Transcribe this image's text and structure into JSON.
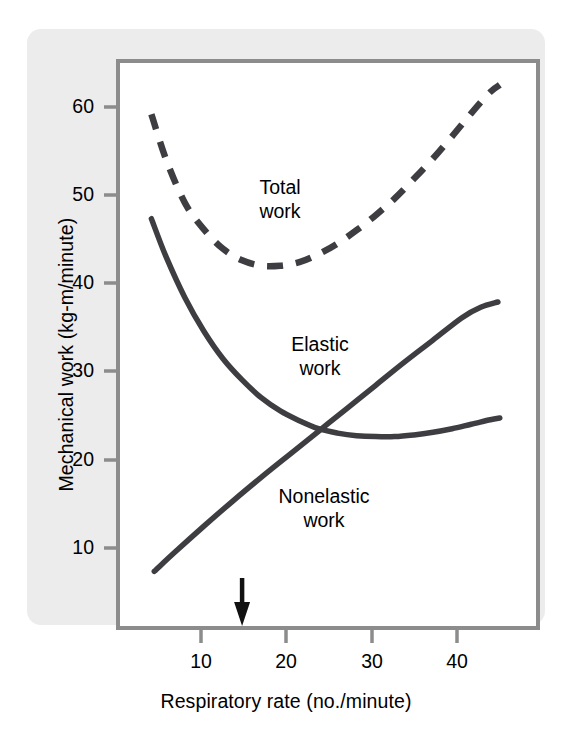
{
  "figure": {
    "background_color": "#ffffff",
    "card_color": "#ececec",
    "frame_color": "#8c8c8c",
    "curve_color": "#3e3e42",
    "text_color": "#000000"
  },
  "axes": {
    "x_title": "Respiratory rate (no./minute)",
    "y_title": "Mechanical work (kg-m/minute)",
    "x_ticks": [
      "10",
      "20",
      "30",
      "40"
    ],
    "y_ticks": [
      "60",
      "50",
      "40",
      "30",
      "20",
      "10"
    ]
  },
  "labels": {
    "total_line1": "Total",
    "total_line2": "work",
    "elastic_line1": "Elastic",
    "elastic_line2": "work",
    "nonelastic_line1": "Nonelastic",
    "nonelastic_line2": "work"
  },
  "annotations": {
    "optimum_arrow_label": "optimal respiratory rate arrow",
    "optimum_x_value": 15
  },
  "chart_data": {
    "type": "line",
    "title": "",
    "xlabel": "Respiratory rate (no./minute)",
    "ylabel": "Mechanical work (kg-m/minute)",
    "xlim": [
      2,
      46
    ],
    "ylim": [
      2,
      66
    ],
    "x_ticks": [
      10,
      20,
      30,
      40
    ],
    "y_ticks": [
      10,
      20,
      30,
      40,
      50,
      60
    ],
    "grid": false,
    "legend": "inline-labels",
    "annotations": [
      {
        "type": "arrow",
        "x": 15,
        "y": 2,
        "direction": "down",
        "note": "optimum respiratory rate"
      }
    ],
    "series": [
      {
        "name": "Total work",
        "style": "dashed",
        "x": [
          5.5,
          7,
          9,
          11,
          13,
          15,
          17,
          19,
          21,
          23,
          25,
          27,
          29,
          31,
          33,
          35,
          37,
          39,
          41,
          42
        ],
        "values": [
          60.0,
          55.0,
          50.0,
          47.0,
          44.8,
          43.5,
          42.9,
          42.9,
          43.3,
          44.2,
          45.4,
          46.9,
          48.6,
          50.5,
          52.7,
          55.0,
          57.5,
          60.1,
          62.5,
          63.3
        ]
      },
      {
        "name": "Elastic work",
        "style": "solid",
        "x": [
          5.5,
          7,
          9,
          11,
          13,
          15,
          17,
          19,
          21,
          23,
          25,
          27,
          29,
          31,
          33,
          35,
          37,
          39,
          41,
          42
        ],
        "values": [
          48.2,
          44.0,
          39.3,
          35.5,
          32.4,
          30.0,
          28.0,
          26.5,
          25.4,
          24.5,
          24.0,
          23.7,
          23.6,
          23.6,
          23.8,
          24.1,
          24.5,
          25.0,
          25.5,
          25.7
        ]
      },
      {
        "name": "Nonelastic work",
        "style": "solid",
        "x": [
          5.8,
          8,
          11,
          14,
          17,
          20,
          23,
          26,
          29,
          32,
          35,
          38,
          40,
          41.8
        ],
        "values": [
          8.4,
          10.6,
          13.5,
          16.3,
          19.0,
          21.6,
          24.2,
          26.8,
          29.4,
          32.0,
          34.5,
          37.0,
          38.2,
          38.8
        ]
      }
    ]
  }
}
